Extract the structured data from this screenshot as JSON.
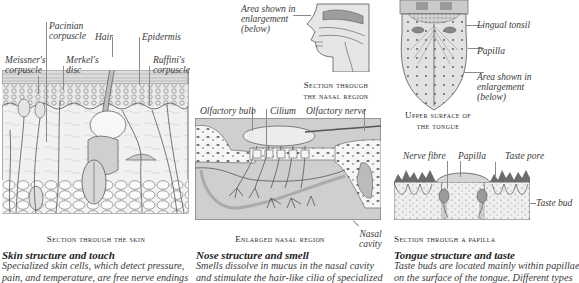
{
  "skin": {
    "labels": {
      "pacinian": "Pacinian\ncorpuscle",
      "hair": "Hair",
      "epidermis": "Epidermis",
      "meissner": "Meissner's\ncorpuscle",
      "merkel": "Merkel's\ndisc",
      "ruffini": "Ruffini's\ncorpuscle"
    },
    "caption": "Section through the skin",
    "heading": "Skin structure and touch",
    "text": "Specialized skin cells, which detect pressure,\npain, and temperature, are free nerve endings"
  },
  "nose": {
    "labels": {
      "area": "Area shown in\nenlargement\n(below)",
      "olfactory_bulb": "Olfactory bulb",
      "cilium": "Cilium",
      "olfactory_nerve": "Olfactory nerve",
      "nasal_cavity": "Nasal\ncavity"
    },
    "caption_top": "Section through\nthe nasal region",
    "caption_enlarged": "Enlarged nasal region",
    "heading": "Nose structure and smell",
    "text": "Smells dissolve in mucus in the nasal cavity\nand stimulate the hair-like cilia of specialized"
  },
  "tongue": {
    "labels": {
      "lingual_tonsil": "Lingual tonsil",
      "papilla": "Papilla",
      "area": "Area shown in\nenlargement\n(below)",
      "nerve_fibre": "Nerve fibre",
      "papilla2": "Papilla",
      "taste_pore": "Taste pore",
      "taste_bud": "Taste bud"
    },
    "caption_top": "Upper surface of\nthe tongue",
    "caption_papilla": "Section through a papilla",
    "heading": "Tongue structure and taste",
    "text": "Taste buds are located mainly within papillae\non the surface of the tongue. Different types"
  }
}
